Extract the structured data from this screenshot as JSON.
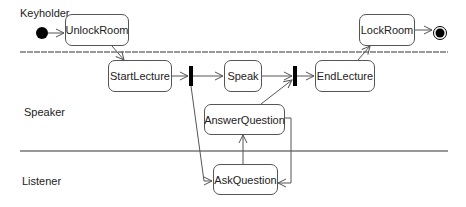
{
  "diagram": {
    "type": "UML activity diagram with swimlanes",
    "lanes": [
      {
        "id": "keyholder",
        "label": "Keyholder"
      },
      {
        "id": "speaker",
        "label": "Speaker"
      },
      {
        "id": "listener",
        "label": "Listener"
      }
    ],
    "actions": {
      "unlock_room": "UnlockRoom",
      "start_lecture": "StartLecture",
      "speak": "Speak",
      "end_lecture": "EndLecture",
      "lock_room": "LockRoom",
      "answer_question": "AnswerQuestion",
      "ask_question": "AskQuestion"
    },
    "nodes": {
      "initial": "initial-node",
      "final": "final-node",
      "fork": "fork-bar",
      "join": "join-bar"
    },
    "flows": [
      {
        "from": "initial",
        "to": "UnlockRoom"
      },
      {
        "from": "UnlockRoom",
        "to": "StartLecture"
      },
      {
        "from": "StartLecture",
        "to": "fork"
      },
      {
        "from": "fork",
        "to": "Speak"
      },
      {
        "from": "fork",
        "to": "AskQuestion"
      },
      {
        "from": "Speak",
        "to": "join"
      },
      {
        "from": "AnswerQuestion",
        "to": "join"
      },
      {
        "from": "AskQuestion",
        "to": "AnswerQuestion"
      },
      {
        "from": "AnswerQuestion",
        "to": "AskQuestion"
      },
      {
        "from": "join",
        "to": "EndLecture"
      },
      {
        "from": "EndLecture",
        "to": "LockRoom"
      },
      {
        "from": "LockRoom",
        "to": "final"
      }
    ],
    "colors": {
      "line": "#555555",
      "fill": "#000000",
      "background": "#ffffff"
    }
  }
}
